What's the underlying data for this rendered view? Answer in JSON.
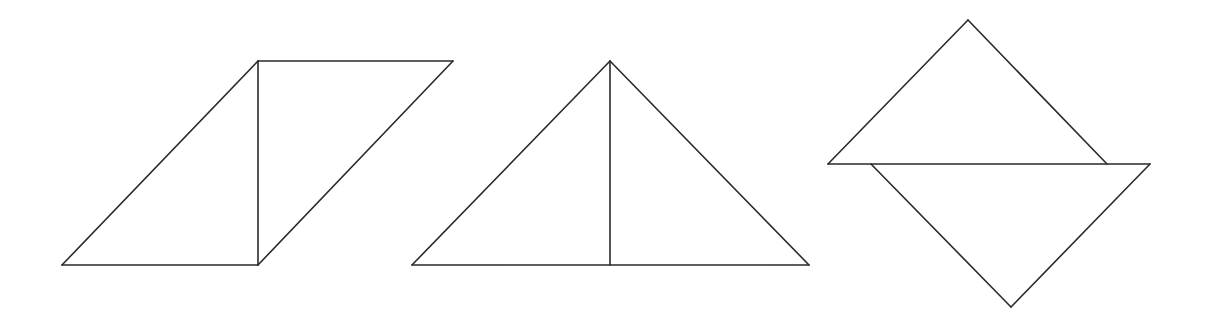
{
  "canvas": {
    "width": 1205,
    "height": 327,
    "background": "#ffffff"
  },
  "style": {
    "stroke": "#2a2a2a",
    "stroke_width": 1.6
  },
  "figures": [
    {
      "id": "parallelogram-split",
      "description": "Parallelogram divided by a vertical line into two right triangles",
      "edges": [
        [
          62,
          265,
          258,
          61
        ],
        [
          258,
          61,
          453,
          61
        ],
        [
          453,
          61,
          258,
          265
        ],
        [
          258,
          265,
          62,
          265
        ],
        [
          258,
          61,
          258,
          265
        ]
      ]
    },
    {
      "id": "isosceles-triangle-split",
      "description": "Isosceles triangle divided by a vertical altitude into two right triangles",
      "edges": [
        [
          412,
          265,
          610,
          61
        ],
        [
          610,
          61,
          809,
          265
        ],
        [
          809,
          265,
          412,
          265
        ],
        [
          610,
          61,
          610,
          265
        ]
      ]
    },
    {
      "id": "offset-triangles",
      "description": "Two right isosceles triangles sharing a horizontal line, one pointing up and one pointing down, horizontally offset",
      "edges": [
        [
          828,
          164,
          968,
          20
        ],
        [
          968,
          20,
          1107,
          164
        ],
        [
          828,
          164,
          1150,
          164
        ],
        [
          871,
          164,
          1011,
          307
        ],
        [
          1011,
          307,
          1150,
          164
        ]
      ]
    }
  ]
}
